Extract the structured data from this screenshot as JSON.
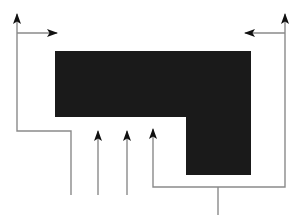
{
  "figure": {
    "canvas": {
      "width": 296,
      "height": 221,
      "background": "#ffffff"
    },
    "colors": {
      "shape_fill": "#1a1a1a",
      "line_stroke": "#8a8a8a",
      "arrowhead_fill": "#111111",
      "background": "#ffffff"
    },
    "stroke_width": 1.4,
    "shapes": [
      {
        "name": "l-shaped-block",
        "kind": "polygon",
        "fill": "#1a1a1a",
        "points": "55,51 251,51 251,175 186,175 186,117 55,117"
      }
    ],
    "paths": [
      {
        "name": "left-outlet-path",
        "d": "M 17,14 L 17,131 L 71,131 L 71,195",
        "arrowheads": [
          {
            "at": "start",
            "direction": "up",
            "x": 17,
            "y": 14
          }
        ]
      },
      {
        "name": "left-branch-path",
        "d": "M 17,33 L 57,33",
        "arrowheads": [
          {
            "at": "end",
            "direction": "right",
            "x": 57,
            "y": 33
          }
        ]
      },
      {
        "name": "center-left-arrow-path",
        "d": "M 98,131 L 98,195",
        "arrowheads": [
          {
            "at": "start",
            "direction": "up",
            "x": 98,
            "y": 131
          }
        ]
      },
      {
        "name": "center-right-arrow-path",
        "d": "M 127,131 L 127,195",
        "arrowheads": [
          {
            "at": "start",
            "direction": "up",
            "x": 127,
            "y": 131
          }
        ]
      },
      {
        "name": "lower-feed-path",
        "d": "M 153,129 L 153,187 L 285,187 L 285,14",
        "arrowheads": [
          {
            "at": "start",
            "direction": "up",
            "x": 153,
            "y": 129
          },
          {
            "at": "end",
            "direction": "up",
            "x": 285,
            "y": 14
          }
        ]
      },
      {
        "name": "right-branch-path",
        "d": "M 285,33 L 245,33",
        "arrowheads": [
          {
            "at": "end",
            "direction": "left",
            "x": 245,
            "y": 33
          }
        ]
      },
      {
        "name": "bottom-stem-path",
        "d": "M 218,187 L 218,215",
        "arrowheads": []
      }
    ],
    "arrowhead_geometry": {
      "length": 11,
      "half_width": 4
    }
  }
}
